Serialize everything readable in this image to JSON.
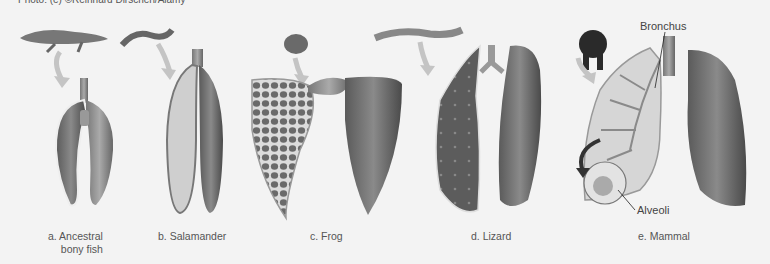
{
  "figure": {
    "credit": "Photo: (e) ©Reinhard Dirscherl/Alamy",
    "background": "#f3f3f3",
    "panels": [
      {
        "id": "a",
        "label_line1": "a. Ancestral",
        "label_line2": "bony fish",
        "animal": "fish"
      },
      {
        "id": "b",
        "label_line1": "b. Salamander",
        "animal": "salamander"
      },
      {
        "id": "c",
        "label_line1": "c. Frog",
        "animal": "frog"
      },
      {
        "id": "d",
        "label_line1": "d. Lizard",
        "animal": "lizard"
      },
      {
        "id": "e",
        "label_line1": "e. Mammal",
        "animal": "gorilla"
      }
    ],
    "callouts": {
      "bronchus": "Bronchus",
      "alveoli": "Alveoli"
    }
  }
}
